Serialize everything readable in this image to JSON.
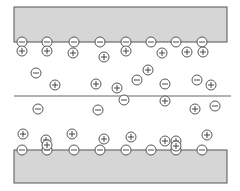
{
  "diagram": {
    "colors": {
      "plate_fill": "#d6d6d6",
      "plate_stroke": "#555555",
      "ion_stroke": "#444444",
      "background": "#ffffff"
    },
    "top_plate": {
      "x": 14,
      "y": 7,
      "width": 213,
      "height": 35
    },
    "bottom_plate": {
      "x": 14,
      "y": 150,
      "width": 213,
      "height": 33
    },
    "midline": {
      "x1": 14,
      "y1": 96,
      "x2": 231,
      "y2": 96
    },
    "ion_radius": 5,
    "surface_charges_top": [
      {
        "x": 22,
        "y": 42,
        "sign": "-"
      },
      {
        "x": 47,
        "y": 42,
        "sign": "-"
      },
      {
        "x": 74,
        "y": 42,
        "sign": "-"
      },
      {
        "x": 100,
        "y": 42,
        "sign": "-"
      },
      {
        "x": 126,
        "y": 42,
        "sign": "-"
      },
      {
        "x": 151,
        "y": 42,
        "sign": "-"
      },
      {
        "x": 176,
        "y": 42,
        "sign": "-"
      },
      {
        "x": 202,
        "y": 42,
        "sign": "-"
      }
    ],
    "surface_charges_bottom": [
      {
        "x": 22,
        "y": 150,
        "sign": "-"
      },
      {
        "x": 47,
        "y": 150,
        "sign": "-"
      },
      {
        "x": 74,
        "y": 150,
        "sign": "-"
      },
      {
        "x": 100,
        "y": 150,
        "sign": "-"
      },
      {
        "x": 126,
        "y": 150,
        "sign": "-"
      },
      {
        "x": 151,
        "y": 150,
        "sign": "-"
      },
      {
        "x": 176,
        "y": 150,
        "sign": "-"
      },
      {
        "x": 202,
        "y": 150,
        "sign": "-"
      }
    ],
    "solution_ions": [
      {
        "x": 22,
        "y": 51,
        "sign": "+"
      },
      {
        "x": 47,
        "y": 51,
        "sign": "+"
      },
      {
        "x": 73,
        "y": 53,
        "sign": "+"
      },
      {
        "x": 104,
        "y": 57,
        "sign": "+"
      },
      {
        "x": 126,
        "y": 51,
        "sign": "+"
      },
      {
        "x": 162,
        "y": 53,
        "sign": "+"
      },
      {
        "x": 187,
        "y": 52,
        "sign": "+"
      },
      {
        "x": 203,
        "y": 52,
        "sign": "+"
      },
      {
        "x": 36,
        "y": 73,
        "sign": "-"
      },
      {
        "x": 148,
        "y": 70,
        "sign": "+"
      },
      {
        "x": 55,
        "y": 85,
        "sign": "+"
      },
      {
        "x": 96,
        "y": 84,
        "sign": "+"
      },
      {
        "x": 117,
        "y": 88,
        "sign": "+"
      },
      {
        "x": 137,
        "y": 80,
        "sign": "-"
      },
      {
        "x": 165,
        "y": 84,
        "sign": "-"
      },
      {
        "x": 197,
        "y": 80,
        "sign": "-"
      },
      {
        "x": 211,
        "y": 85,
        "sign": "+"
      },
      {
        "x": 124,
        "y": 100,
        "sign": "-"
      },
      {
        "x": 165,
        "y": 101,
        "sign": "+"
      },
      {
        "x": 38,
        "y": 109,
        "sign": "-"
      },
      {
        "x": 98,
        "y": 110,
        "sign": "-"
      },
      {
        "x": 195,
        "y": 109,
        "sign": "+"
      },
      {
        "x": 215,
        "y": 106,
        "sign": "-"
      },
      {
        "x": 23,
        "y": 134,
        "sign": "+"
      },
      {
        "x": 46,
        "y": 140,
        "sign": "+"
      },
      {
        "x": 72,
        "y": 134,
        "sign": "+"
      },
      {
        "x": 104,
        "y": 139,
        "sign": "+"
      },
      {
        "x": 131,
        "y": 137,
        "sign": "+"
      },
      {
        "x": 165,
        "y": 141,
        "sign": "+"
      },
      {
        "x": 176,
        "y": 141,
        "sign": "+"
      },
      {
        "x": 207,
        "y": 135,
        "sign": "+"
      },
      {
        "x": 47,
        "y": 145,
        "sign": "+"
      },
      {
        "x": 176,
        "y": 146,
        "sign": "+"
      }
    ]
  }
}
